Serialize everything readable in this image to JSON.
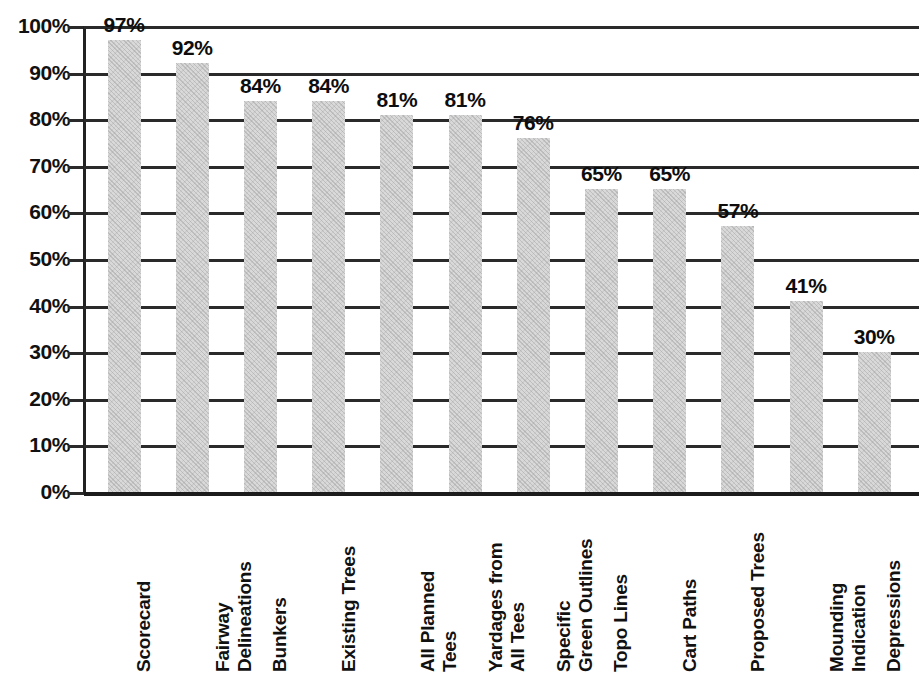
{
  "chart_data": {
    "type": "bar",
    "title": "",
    "subtitle": "",
    "xlabel": "",
    "ylabel": "",
    "ylim": [
      0,
      100
    ],
    "grid": true,
    "legend": false,
    "orientation": "vertical",
    "value_suffix": "%",
    "categories": [
      "Scorecard",
      "Fairway Delineations",
      "Bunkers",
      "Existing Trees",
      "All Planned Tees",
      "Yardages from All Tees",
      "Specific Green Outlines",
      "Topo Lines",
      "Cart Paths",
      "Proposed Trees",
      "Mounding Indication",
      "Depressions"
    ],
    "category_lines": [
      [
        "Scorecard"
      ],
      [
        "Fairway",
        "Delineations"
      ],
      [
        "Bunkers"
      ],
      [
        "Existing Trees"
      ],
      [
        "All Planned",
        "Tees"
      ],
      [
        "Yardages from",
        "All Tees"
      ],
      [
        "Specific",
        "Green Outlines"
      ],
      [
        "Topo Lines"
      ],
      [
        "Cart Paths"
      ],
      [
        "Proposed Trees"
      ],
      [
        "Mounding",
        "Indication"
      ],
      [
        "Depressions"
      ]
    ],
    "values": [
      97,
      92,
      84,
      84,
      81,
      81,
      76,
      65,
      65,
      57,
      41,
      30
    ],
    "value_labels": [
      "97%",
      "92%",
      "84%",
      "84%",
      "81%",
      "81%",
      "76%",
      "65%",
      "65%",
      "57%",
      "41%",
      "30%"
    ],
    "yticks": [
      0,
      10,
      20,
      30,
      40,
      50,
      60,
      70,
      80,
      90,
      100
    ],
    "ytick_labels": [
      "0%",
      "10%",
      "20%",
      "30%",
      "40%",
      "50%",
      "60%",
      "70%",
      "80%",
      "90%",
      "100%"
    ],
    "colors": {
      "bar_fill": "#d9d9d9",
      "bar_hatch": "#969696",
      "gridline": "#2a2a2a",
      "axis": "#222222",
      "text": "#111111",
      "background": "#ffffff"
    }
  }
}
